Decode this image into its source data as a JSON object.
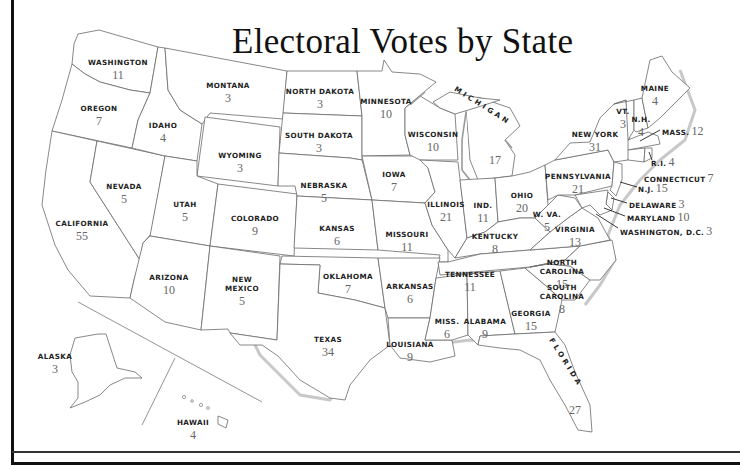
{
  "title": "Electoral Votes by State",
  "states": [
    {
      "id": "washington",
      "name": "WASHINGTON",
      "votes": "11",
      "x": 118,
      "y": 58
    },
    {
      "id": "oregon",
      "name": "OREGON",
      "votes": "7",
      "x": 99,
      "y": 104
    },
    {
      "id": "california",
      "name": "CALIFORNIA",
      "votes": "55",
      "x": 82,
      "y": 219
    },
    {
      "id": "nevada",
      "name": "NEVADA",
      "votes": "5",
      "x": 124,
      "y": 182
    },
    {
      "id": "idaho",
      "name": "IDAHO",
      "votes": "4",
      "x": 163,
      "y": 121
    },
    {
      "id": "montana",
      "name": "MONTANA",
      "votes": "3",
      "x": 228,
      "y": 81
    },
    {
      "id": "wyoming",
      "name": "WYOMING",
      "votes": "3",
      "x": 240,
      "y": 151
    },
    {
      "id": "utah",
      "name": "UTAH",
      "votes": "5",
      "x": 185,
      "y": 200
    },
    {
      "id": "colorado",
      "name": "COLORADO",
      "votes": "9",
      "x": 255,
      "y": 214
    },
    {
      "id": "arizona",
      "name": "ARIZONA",
      "votes": "10",
      "x": 169,
      "y": 273
    },
    {
      "id": "new-mexico",
      "name": "NEW\nMEXICO",
      "votes": "5",
      "x": 242,
      "y": 275
    },
    {
      "id": "north-dakota",
      "name": "NORTH DAKOTA",
      "votes": "3",
      "x": 320,
      "y": 87
    },
    {
      "id": "south-dakota",
      "name": "SOUTH DAKOTA",
      "votes": "3",
      "x": 319,
      "y": 131
    },
    {
      "id": "nebraska",
      "name": "NEBRASKA",
      "votes": "5",
      "x": 324,
      "y": 181
    },
    {
      "id": "kansas",
      "name": "KANSAS",
      "votes": "6",
      "x": 337,
      "y": 224
    },
    {
      "id": "oklahoma",
      "name": "OKLAHOMA",
      "votes": "7",
      "x": 348,
      "y": 272
    },
    {
      "id": "texas",
      "name": "TEXAS",
      "votes": "34",
      "x": 328,
      "y": 335
    },
    {
      "id": "minnesota",
      "name": "MINNESOTA",
      "votes": "10",
      "x": 386,
      "y": 97
    },
    {
      "id": "iowa",
      "name": "IOWA",
      "votes": "7",
      "x": 394,
      "y": 170
    },
    {
      "id": "missouri",
      "name": "MISSOURI",
      "votes": "11",
      "x": 407,
      "y": 230
    },
    {
      "id": "arkansas",
      "name": "ARKANSAS",
      "votes": "6",
      "x": 410,
      "y": 282
    },
    {
      "id": "louisiana",
      "name": "LOUISIANA",
      "votes": "9",
      "x": 410,
      "y": 340
    },
    {
      "id": "wisconsin",
      "name": "WISCONSIN",
      "votes": "10",
      "x": 433,
      "y": 130
    },
    {
      "id": "illinois",
      "name": "ILLINOIS",
      "votes": "21",
      "x": 446,
      "y": 200
    },
    {
      "id": "michigan",
      "name": "MICHIGAN",
      "votes": "17",
      "x": 495,
      "y": 154
    },
    {
      "id": "indiana",
      "name": "IND.",
      "votes": "11",
      "x": 483,
      "y": 201
    },
    {
      "id": "ohio",
      "name": "OHIO",
      "votes": "20",
      "x": 522,
      "y": 191
    },
    {
      "id": "kentucky",
      "name": "KENTUCKY",
      "votes": "8",
      "x": 495,
      "y": 232
    },
    {
      "id": "tennessee",
      "name": "TENNESSEE",
      "votes": "11",
      "x": 470,
      "y": 270
    },
    {
      "id": "mississippi",
      "name": "MISS.",
      "votes": "6",
      "x": 447,
      "y": 317
    },
    {
      "id": "alabama",
      "name": "ALABAMA",
      "votes": "9",
      "x": 485,
      "y": 317
    },
    {
      "id": "georgia",
      "name": "GEORGIA",
      "votes": "15",
      "x": 531,
      "y": 309
    },
    {
      "id": "florida",
      "name": "FLORIDA",
      "votes": "27",
      "x": 575,
      "y": 404
    },
    {
      "id": "south-carolina",
      "name": "SOUTH\nCAROLINA",
      "votes": "8",
      "x": 562,
      "y": 283
    },
    {
      "id": "north-carolina",
      "name": "NORTH\nCAROLINA",
      "votes": "15",
      "x": 562,
      "y": 258
    },
    {
      "id": "virginia",
      "name": "VIRGINIA",
      "votes": "13",
      "x": 575,
      "y": 225
    },
    {
      "id": "west-virginia",
      "name": "W. VA.",
      "votes": "5",
      "x": 547,
      "y": 210
    },
    {
      "id": "pennsylvania",
      "name": "PENNSYLVANIA",
      "votes": "21",
      "x": 578,
      "y": 172
    },
    {
      "id": "new-york",
      "name": "NEW YORK",
      "votes": "31",
      "x": 595,
      "y": 130
    },
    {
      "id": "vermont",
      "name": "VT.",
      "votes": "3",
      "x": 623,
      "y": 107
    },
    {
      "id": "new-hampshire",
      "name": "N.H.",
      "votes": "4",
      "x": 641,
      "y": 115
    },
    {
      "id": "maine",
      "name": "MAINE",
      "votes": "4",
      "x": 655,
      "y": 84
    },
    {
      "id": "alaska",
      "name": "ALASKA",
      "votes": "3",
      "x": 55,
      "y": 352
    },
    {
      "id": "hawaii",
      "name": "HAWAII",
      "votes": "4",
      "x": 193,
      "y": 418
    }
  ],
  "side_labels": [
    {
      "id": "massachusetts",
      "name": "MASS.",
      "votes": "12",
      "x": 662,
      "y": 127
    },
    {
      "id": "rhode-island",
      "name": "R.I.",
      "votes": "4",
      "x": 651,
      "y": 158
    },
    {
      "id": "connecticut",
      "name": "CONNECTICUT",
      "votes": "7",
      "x": 644,
      "y": 174
    },
    {
      "id": "new-jersey",
      "name": "N.J.",
      "votes": "15",
      "x": 638,
      "y": 184
    },
    {
      "id": "delaware",
      "name": "DELAWARE",
      "votes": "3",
      "x": 629,
      "y": 200
    },
    {
      "id": "maryland",
      "name": "MARYLAND",
      "votes": "10",
      "x": 627,
      "y": 213
    },
    {
      "id": "washington-dc",
      "name": "WASHINGTON, D.C.",
      "votes": "3",
      "x": 620,
      "y": 227
    }
  ],
  "chart_data": {
    "type": "choropleth-labels",
    "title": "Electoral Votes by State",
    "values": {
      "Washington": 11,
      "Oregon": 7,
      "California": 55,
      "Nevada": 5,
      "Idaho": 4,
      "Montana": 3,
      "Wyoming": 3,
      "Utah": 5,
      "Colorado": 9,
      "Arizona": 10,
      "New Mexico": 5,
      "North Dakota": 3,
      "South Dakota": 3,
      "Nebraska": 5,
      "Kansas": 6,
      "Oklahoma": 7,
      "Texas": 34,
      "Minnesota": 10,
      "Iowa": 7,
      "Missouri": 11,
      "Arkansas": 6,
      "Louisiana": 9,
      "Wisconsin": 10,
      "Illinois": 21,
      "Michigan": 17,
      "Indiana": 11,
      "Ohio": 20,
      "Kentucky": 8,
      "Tennessee": 11,
      "Mississippi": 6,
      "Alabama": 9,
      "Georgia": 15,
      "Florida": 27,
      "South Carolina": 8,
      "North Carolina": 15,
      "Virginia": 13,
      "West Virginia": 5,
      "Pennsylvania": 21,
      "New York": 31,
      "Vermont": 3,
      "New Hampshire": 4,
      "Maine": 4,
      "Massachusetts": 12,
      "Rhode Island": 4,
      "Connecticut": 7,
      "New Jersey": 15,
      "Delaware": 3,
      "Maryland": 10,
      "Washington, D.C.": 3,
      "Alaska": 3,
      "Hawaii": 4
    }
  }
}
